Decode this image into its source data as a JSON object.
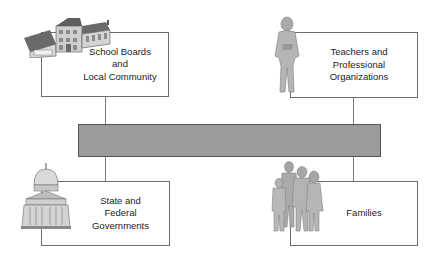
{
  "diagram": {
    "center_bar": {
      "label": "",
      "fill": "#9b9b9b",
      "border": "#555555"
    },
    "boxes": [
      {
        "id": "school-boards",
        "label": "School Boards\nand\nLocal Community",
        "icon": "school-building-icon"
      },
      {
        "id": "teachers",
        "label": "Teachers and\nProfessional\nOrganizations",
        "icon": "teacher-figure-icon"
      },
      {
        "id": "government",
        "label": "State and\nFederal\nGovernments",
        "icon": "capitol-building-icon"
      },
      {
        "id": "families",
        "label": "Families",
        "icon": "family-group-icon"
      }
    ]
  }
}
